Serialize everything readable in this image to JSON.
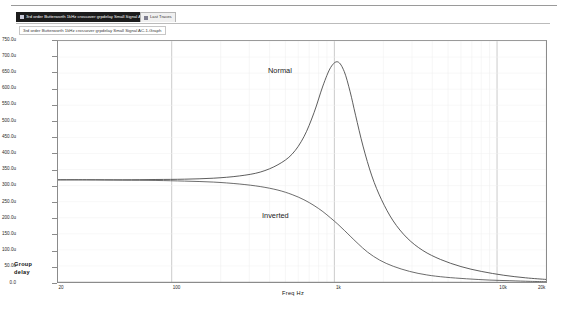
{
  "tabs": [
    {
      "label": "3rd order Butterworth 1kHz crossover grpdelay Small Signal AC-1-Graph",
      "active": true,
      "icon": "graph-icon"
    },
    {
      "label": "Last Traces",
      "active": false,
      "icon": "graph-icon"
    }
  ],
  "window_title": "3rd order Butterworth 1kHz crossover grpdelay Small Signal AC-1-Graph",
  "chart_data": {
    "type": "line",
    "title": "3rd order Butterworth 1kHz crossover grpdelay Small Signal AC-1-Graph",
    "xlabel": "Freq  Hz",
    "ylabel": "Group delay",
    "xscale": "log",
    "xlim": [
      20,
      20000
    ],
    "ylim": [
      0,
      750
    ],
    "y_unit": "u",
    "grid": true,
    "legend": "inline-annotations",
    "xticks": [
      {
        "value": 20,
        "label": "20"
      },
      {
        "value": 100,
        "label": "100"
      },
      {
        "value": 1000,
        "label": "1k"
      },
      {
        "value": 10000,
        "label": "10k"
      },
      {
        "value": 20000,
        "label": "20k"
      }
    ],
    "yticks": [
      {
        "value": 750,
        "label": "750.0u"
      },
      {
        "value": 700,
        "label": "700.0u"
      },
      {
        "value": 650,
        "label": "650.0u"
      },
      {
        "value": 600,
        "label": "600.0u"
      },
      {
        "value": 550,
        "label": "550.0u"
      },
      {
        "value": 500,
        "label": "500.0u"
      },
      {
        "value": 450,
        "label": "450.0u"
      },
      {
        "value": 400,
        "label": "400.0u"
      },
      {
        "value": 350,
        "label": "350.0u"
      },
      {
        "value": 300,
        "label": "300.0u"
      },
      {
        "value": 250,
        "label": "250.0u"
      },
      {
        "value": 200,
        "label": "200.0u"
      },
      {
        "value": 150,
        "label": "150.0u"
      },
      {
        "value": 100,
        "label": "100.0u"
      },
      {
        "value": 50,
        "label": "50.0u"
      },
      {
        "value": 0,
        "label": "0.0"
      }
    ],
    "series": [
      {
        "name": "Normal",
        "annotation": "Normal",
        "color": "#4a4a4a",
        "x": [
          20,
          30,
          50,
          80,
          120,
          180,
          260,
          350,
          450,
          550,
          650,
          750,
          850,
          950,
          1050,
          1150,
          1250,
          1350,
          1500,
          1700,
          1950,
          2300,
          2800,
          3500,
          4500,
          6000,
          8000,
          11000,
          15000,
          20000
        ],
        "y": [
          318,
          318,
          318,
          319,
          320,
          323,
          330,
          342,
          365,
          398,
          452,
          527,
          610,
          668,
          685,
          655,
          592,
          519,
          423,
          330,
          256,
          190,
          137,
          98,
          70,
          48,
          33,
          21,
          13,
          8
        ]
      },
      {
        "name": "Inverted",
        "annotation": "Inverted",
        "color": "#5a5a5a",
        "x": [
          20,
          30,
          50,
          80,
          120,
          180,
          260,
          350,
          450,
          550,
          650,
          750,
          850,
          950,
          1050,
          1150,
          1250,
          1400,
          1600,
          1900,
          2300,
          2900,
          3700,
          4800,
          6500,
          9000,
          12000,
          16000,
          20000
        ],
        "y": [
          318,
          318,
          317,
          316,
          314,
          311,
          305,
          297,
          286,
          272,
          256,
          238,
          219,
          199,
          180,
          161,
          143,
          119,
          93,
          68,
          49,
          33,
          22,
          15,
          10,
          6,
          4,
          2,
          1
        ]
      }
    ],
    "annotations": [
      {
        "text": "Normal",
        "x": 700,
        "y": 620
      },
      {
        "text": "Inverted",
        "x": 620,
        "y": 185
      }
    ]
  }
}
